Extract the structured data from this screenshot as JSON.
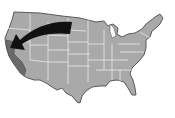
{
  "map": {
    "subject": "United States",
    "highlighted_state": "California",
    "colors": {
      "background": "#ffffff",
      "land": "#a9a9a9",
      "highlight": "#6a6a6a",
      "border": "#f2f2f2",
      "outline": "#5a5a5a",
      "arrow": "#111111"
    },
    "arrow": {
      "direction": "west",
      "points_to": "California"
    }
  }
}
